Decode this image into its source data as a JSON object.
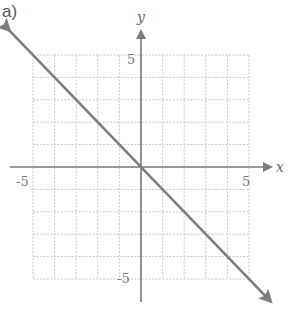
{
  "panel_label": "a)",
  "colors": {
    "grid": "#c8c8c8",
    "axis": "#7a7a7a",
    "line": "#7d7d7d",
    "text": "#666666"
  },
  "chart_data": {
    "type": "line",
    "title": "a)",
    "xlabel": "x",
    "ylabel": "y",
    "xlim": [
      -5,
      5
    ],
    "ylim": [
      -5,
      5
    ],
    "grid": true,
    "grid_step": 1,
    "tick_labels": {
      "x": [
        "-5",
        "5"
      ],
      "y": [
        "5",
        "-5"
      ]
    },
    "series": [
      {
        "name": "y = -x",
        "equation": "y = -x",
        "slope": -1,
        "intercept": 0,
        "arrows": "both",
        "x": [
          -6.1,
          6.0
        ],
        "y": [
          6.1,
          -6.0
        ]
      }
    ]
  }
}
